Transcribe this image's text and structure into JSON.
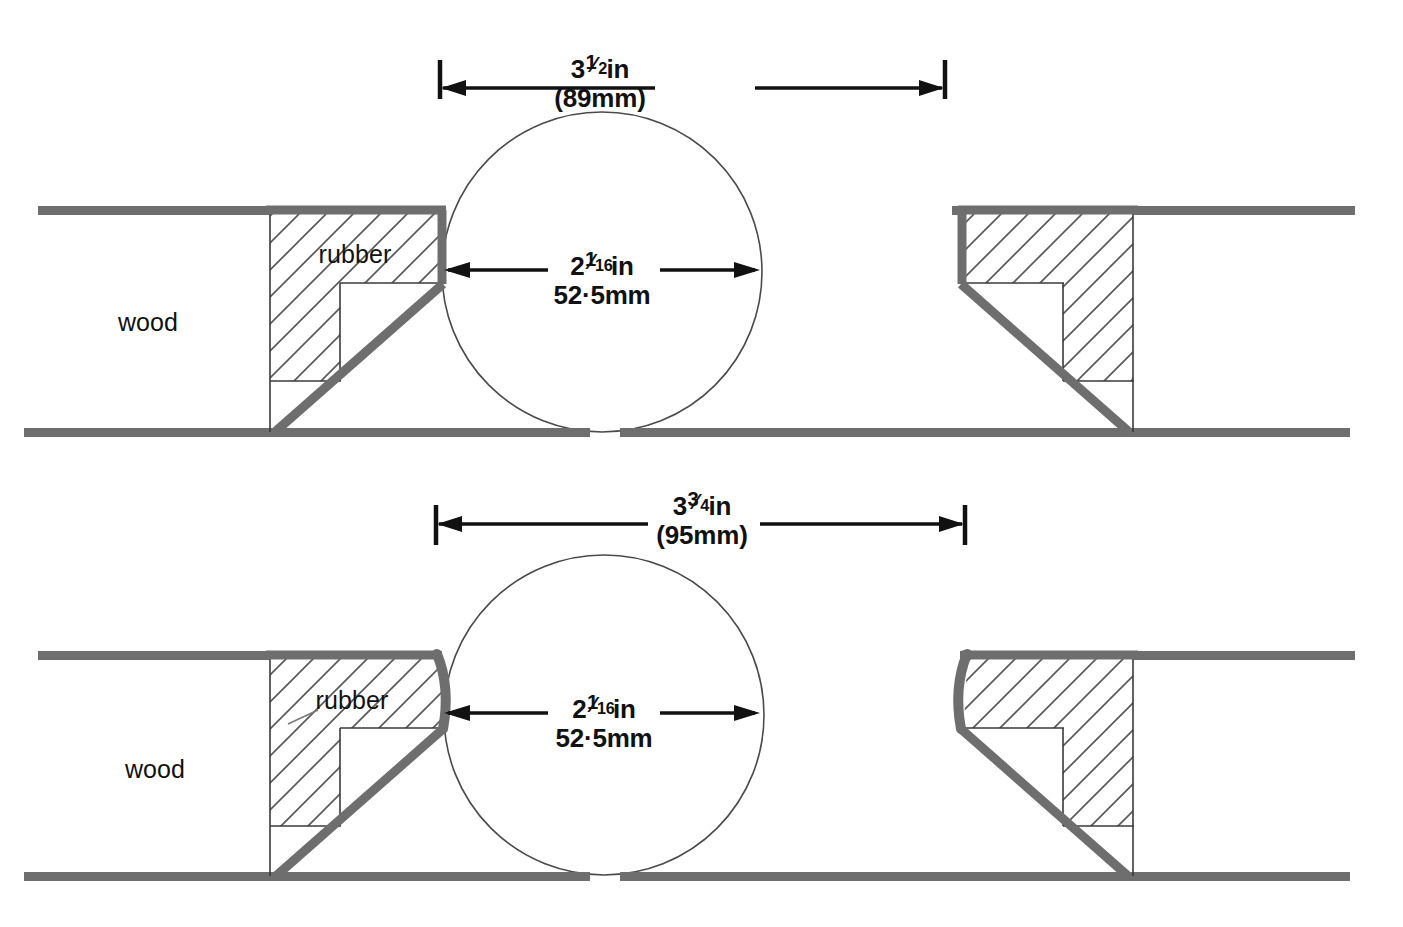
{
  "diagram": {
    "colors": {
      "outline_gray": "#6e6e6e",
      "hatch_gray": "#5a5a5a",
      "thin_line": "#3a3a3a",
      "text": "#111111",
      "background": "#ffffff"
    },
    "panels": [
      {
        "id": "top",
        "name": "straight-jaw-variant",
        "outer_dimension": {
          "inches_whole": "3",
          "inches_numerator": "1",
          "inches_denominator": "2",
          "inches_unit": "in",
          "inches_label": "3½in",
          "metric_label": "(89mm)"
        },
        "inner_dimension": {
          "inches_whole": "2",
          "inches_numerator": "1",
          "inches_denominator": "16",
          "inches_unit": "in",
          "inches_label": "2¹⁄₁₆in",
          "metric_label": "52·5mm"
        },
        "labels": {
          "wood": "wood",
          "rubber": "rubber"
        }
      },
      {
        "id": "bottom",
        "name": "curved-jaw-variant",
        "outer_dimension": {
          "inches_whole": "3",
          "inches_numerator": "3",
          "inches_denominator": "4",
          "inches_unit": "in",
          "inches_label": "3¾im",
          "metric_label": "(95mm)"
        },
        "inner_dimension": {
          "inches_whole": "2",
          "inches_numerator": "1",
          "inches_denominator": "16",
          "inches_unit": "in",
          "inches_label": "2¹⁄₁₆in",
          "metric_label": "52·5mm"
        },
        "labels": {
          "wood": "wood",
          "rubber": "rubber"
        }
      }
    ]
  }
}
